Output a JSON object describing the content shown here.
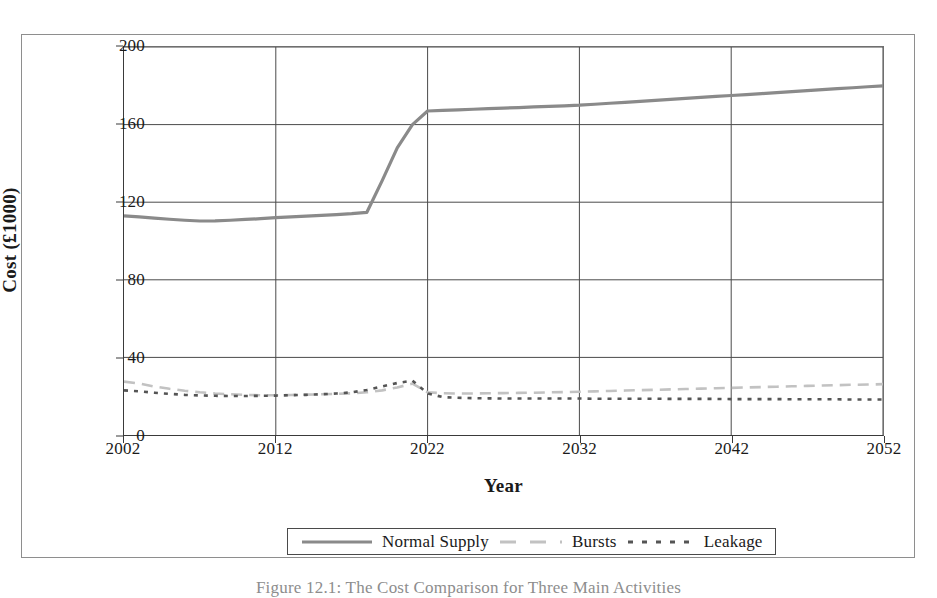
{
  "figure": {
    "caption": "Figure 12.1: The Cost Comparison for Three Main Activities"
  },
  "colors": {
    "normal_supply": "#8a8a8a",
    "bursts": "#c2c2c2",
    "leakage": "#555555",
    "axis": "#3a3a3a",
    "grid": "#4a4a4a",
    "frame": "#8e8e8e"
  },
  "axes": {
    "y_title": "Cost (£1000)",
    "x_title": "Year",
    "y_ticks": [
      "0",
      "40",
      "80",
      "120",
      "160",
      "200"
    ],
    "x_ticks": [
      "2002",
      "2012",
      "2022",
      "2032",
      "2042",
      "2052"
    ]
  },
  "legend": {
    "items": [
      {
        "label": "Normal Supply",
        "style": "solid"
      },
      {
        "label": "Bursts",
        "style": "dashed"
      },
      {
        "label": "Leakage",
        "style": "dotted"
      }
    ]
  },
  "chart_data": {
    "type": "line",
    "title": "",
    "xlabel": "Year",
    "ylabel": "Cost (£1000)",
    "xlim": [
      2002,
      2052
    ],
    "ylim": [
      0,
      200
    ],
    "yticks": [
      0,
      40,
      80,
      120,
      160,
      200
    ],
    "xticks": [
      2002,
      2012,
      2022,
      2032,
      2042,
      2052
    ],
    "grid": true,
    "legend_position": "below-plot",
    "x": [
      2002,
      2003,
      2004,
      2005,
      2006,
      2007,
      2008,
      2009,
      2010,
      2011,
      2012,
      2013,
      2014,
      2015,
      2016,
      2017,
      2018,
      2019,
      2020,
      2021,
      2022,
      2023,
      2024,
      2025,
      2026,
      2027,
      2028,
      2029,
      2030,
      2031,
      2032,
      2033,
      2034,
      2035,
      2036,
      2037,
      2038,
      2039,
      2040,
      2041,
      2042,
      2043,
      2044,
      2045,
      2046,
      2047,
      2048,
      2049,
      2050,
      2051,
      2052
    ],
    "series": [
      {
        "name": "Normal Supply",
        "style": "solid",
        "color": "#8a8a8a",
        "values": [
          113,
          112.4,
          111.8,
          111.2,
          110.7,
          110.3,
          110.4,
          110.7,
          111.1,
          111.5,
          112,
          112.4,
          112.8,
          113.2,
          113.6,
          114.1,
          114.8,
          131,
          148,
          160,
          167,
          167.3,
          167.6,
          167.9,
          168.2,
          168.5,
          168.8,
          169.1,
          169.4,
          169.7,
          170,
          170.5,
          171,
          171.5,
          172,
          172.5,
          173,
          173.5,
          174,
          174.5,
          175,
          175.5,
          176,
          176.5,
          177,
          177.5,
          178,
          178.5,
          179,
          179.5,
          180
        ]
      },
      {
        "name": "Bursts",
        "style": "dashed",
        "color": "#c2c2c2",
        "values": [
          27.5,
          26.5,
          25,
          23.8,
          22.8,
          22,
          21.4,
          21,
          20.7,
          20.5,
          20.5,
          20.6,
          20.8,
          21,
          21.2,
          21.5,
          22,
          23,
          24.5,
          26.5,
          22,
          21.5,
          21.4,
          21.4,
          21.5,
          21.6,
          21.7,
          21.8,
          22,
          22.1,
          22.3,
          22.5,
          22.7,
          22.9,
          23.1,
          23.3,
          23.5,
          23.7,
          23.9,
          24.1,
          24.3,
          24.5,
          24.7,
          24.9,
          25.1,
          25.3,
          25.5,
          25.7,
          25.9,
          26,
          26.2
        ]
      },
      {
        "name": "Leakage",
        "style": "dotted",
        "color": "#555555",
        "values": [
          23,
          22.5,
          21.8,
          21.2,
          20.7,
          20.4,
          20.2,
          20.1,
          20.1,
          20.2,
          20.3,
          20.5,
          20.7,
          21,
          21.4,
          22,
          23.2,
          25,
          26.8,
          28,
          21.5,
          19.5,
          19.2,
          19,
          18.9,
          18.8,
          18.8,
          18.8,
          18.8,
          18.8,
          18.8,
          18.7,
          18.7,
          18.7,
          18.7,
          18.7,
          18.6,
          18.6,
          18.6,
          18.6,
          18.5,
          18.5,
          18.5,
          18.5,
          18.4,
          18.4,
          18.4,
          18.4,
          18.3,
          18.3,
          18.3
        ]
      }
    ]
  }
}
